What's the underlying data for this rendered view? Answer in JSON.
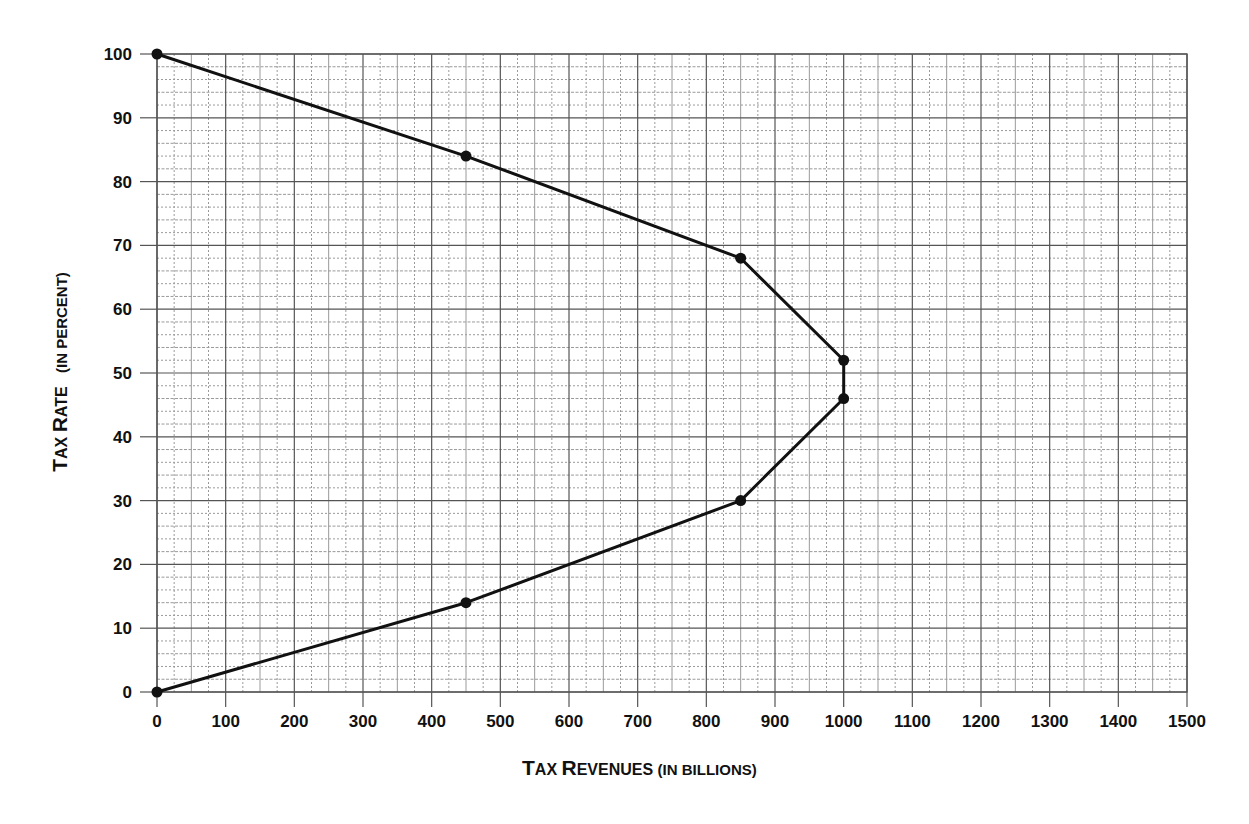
{
  "chart_data": {
    "type": "line",
    "title": "",
    "xlabel": "Tax Revenues (in billions)",
    "ylabel": "Tax Rate (in percent)",
    "xlim": [
      0,
      1500
    ],
    "ylim": [
      0,
      100
    ],
    "x_ticks": [
      0,
      100,
      200,
      300,
      400,
      500,
      600,
      700,
      800,
      900,
      1000,
      1100,
      1200,
      1300,
      1400,
      1500
    ],
    "y_ticks": [
      0,
      10,
      20,
      30,
      40,
      50,
      60,
      70,
      80,
      90,
      100
    ],
    "grid": true,
    "legend": null,
    "series": [
      {
        "name": "Laffer curve",
        "points": [
          {
            "x": 0,
            "y": 100
          },
          {
            "x": 450,
            "y": 84
          },
          {
            "x": 850,
            "y": 68
          },
          {
            "x": 1000,
            "y": 52
          },
          {
            "x": 1000,
            "y": 46
          },
          {
            "x": 850,
            "y": 30
          },
          {
            "x": 450,
            "y": 14
          },
          {
            "x": 0,
            "y": 0
          }
        ],
        "color": "#111111",
        "markers": true
      }
    ]
  },
  "axes": {
    "x_title": {
      "cap1": "T",
      "rest1": "AX ",
      "cap2": "R",
      "rest2": "EVENUES ",
      "paren": "(IN BILLIONS)"
    },
    "y_title": {
      "cap1": "T",
      "rest1": "AX ",
      "cap2": "R",
      "rest2": "ATE ",
      "paren": "(IN PERCENT)"
    }
  },
  "style": {
    "major_grid_color": "#555555",
    "minor_grid_color": "#9a9a9a",
    "line_color": "#111111"
  }
}
